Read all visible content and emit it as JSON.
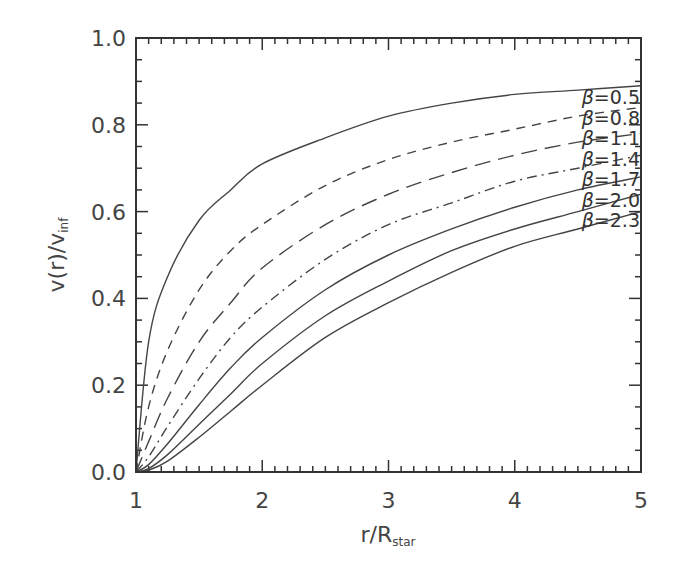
{
  "chart_data": {
    "type": "line",
    "title": "",
    "xlabel": "r/R_star",
    "xlabel_main": "r/R",
    "xlabel_sub": "star",
    "ylabel": "v(r)/v_inf",
    "ylabel_main": "v(r)/v",
    "ylabel_sub": "inf",
    "xlim": [
      1,
      5
    ],
    "ylim": [
      0.0,
      1.0
    ],
    "grid": false,
    "legend_position": "inline-right",
    "x_ticks": [
      "1",
      "2",
      "3",
      "4",
      "5"
    ],
    "y_ticks": [
      "0.0",
      "0.2",
      "0.4",
      "0.6",
      "0.8",
      "1.0"
    ],
    "x": [
      1.0,
      1.1,
      1.25,
      1.5,
      1.75,
      2.0,
      2.5,
      3.0,
      3.5,
      4.0,
      4.5,
      5.0
    ],
    "series": [
      {
        "name": "β=0.5",
        "label_beta": "β",
        "label_value": "=0.5",
        "style": "solid",
        "values": [
          0.0,
          0.3,
          0.45,
          0.58,
          0.65,
          0.71,
          0.77,
          0.82,
          0.85,
          0.87,
          0.88,
          0.89
        ]
      },
      {
        "name": "β=0.8",
        "label_beta": "β",
        "label_value": "=0.8",
        "style": "dashed",
        "values": [
          0.0,
          0.15,
          0.28,
          0.42,
          0.51,
          0.57,
          0.66,
          0.72,
          0.76,
          0.79,
          0.82,
          0.84
        ]
      },
      {
        "name": "β=1.1",
        "label_beta": "β",
        "label_value": "=1.1",
        "style": "longdash",
        "values": [
          0.0,
          0.07,
          0.17,
          0.3,
          0.39,
          0.47,
          0.57,
          0.64,
          0.69,
          0.73,
          0.76,
          0.78
        ]
      },
      {
        "name": "β=1.4",
        "label_beta": "β",
        "label_value": "=1.4",
        "style": "dashdot",
        "values": [
          0.0,
          0.035,
          0.105,
          0.215,
          0.31,
          0.38,
          0.49,
          0.57,
          0.62,
          0.67,
          0.7,
          0.73
        ]
      },
      {
        "name": "β=1.7",
        "label_beta": "β",
        "label_value": "=1.7",
        "style": "solid",
        "values": [
          0.0,
          0.017,
          0.065,
          0.155,
          0.24,
          0.31,
          0.42,
          0.5,
          0.56,
          0.61,
          0.65,
          0.68
        ]
      },
      {
        "name": "β=2.0",
        "label_beta": "β",
        "label_value": "=2.0",
        "style": "solid",
        "values": [
          0.0,
          0.008,
          0.04,
          0.11,
          0.18,
          0.25,
          0.36,
          0.44,
          0.51,
          0.56,
          0.6,
          0.64
        ]
      },
      {
        "name": "β=2.3",
        "label_beta": "β",
        "label_value": "=2.3",
        "style": "solid",
        "values": [
          0.0,
          0.004,
          0.025,
          0.08,
          0.14,
          0.2,
          0.31,
          0.39,
          0.46,
          0.52,
          0.56,
          0.6
        ]
      }
    ]
  }
}
